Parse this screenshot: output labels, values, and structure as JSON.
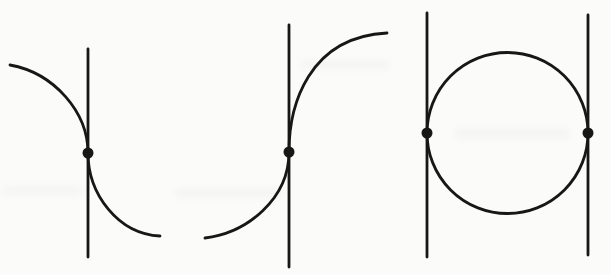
{
  "figure": {
    "ink_color": "#171717",
    "background_color": "#fbfbf9",
    "stroke_width": 2.8,
    "dot_radius": 5.5,
    "width": 611,
    "height": 275,
    "panels": [
      {
        "name": "panel-decreasing-curve-vertical-tangent",
        "vlines": [
          {
            "x": 88,
            "y1": 49,
            "y2": 257
          }
        ],
        "curves": [
          "M 10 65 C 54 73 88 112 88 153 C 88 194 118 234 160 236"
        ],
        "circles": [],
        "dots": [
          {
            "x": 88,
            "y": 153
          }
        ]
      },
      {
        "name": "panel-increasing-curve-vertical-tangent",
        "vlines": [
          {
            "x": 289,
            "y1": 25,
            "y2": 267
          }
        ],
        "curves": [
          "M 205 238 C 247 233 289 199 289 152 C 289 106 308 37 387 33"
        ],
        "circles": [],
        "dots": [
          {
            "x": 289,
            "y": 152
          }
        ]
      },
      {
        "name": "panel-circle-two-vertical-tangents",
        "vlines": [
          {
            "x": 427,
            "y1": 13,
            "y2": 257
          },
          {
            "x": 588,
            "y1": 15,
            "y2": 255
          }
        ],
        "curves": [],
        "circles": [
          {
            "cx": 507.5,
            "cy": 133,
            "r": 80.5
          }
        ],
        "dots": [
          {
            "x": 427,
            "y": 133
          },
          {
            "x": 588,
            "y": 133
          }
        ]
      }
    ],
    "showthrough_smudges": [
      {
        "x": 2,
        "y": 186,
        "w": 80,
        "h": 9
      },
      {
        "x": 175,
        "y": 188,
        "w": 110,
        "h": 10
      },
      {
        "x": 455,
        "y": 128,
        "w": 115,
        "h": 11
      },
      {
        "x": 300,
        "y": 60,
        "w": 90,
        "h": 9
      }
    ]
  }
}
